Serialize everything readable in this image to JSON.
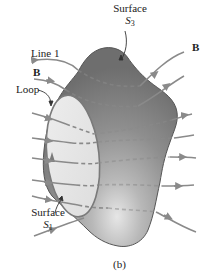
{
  "figure": {
    "caption": "(b)",
    "labels": {
      "surface_s3": {
        "line1": "Surface",
        "symbol": "S",
        "subscript": "3"
      },
      "surface_s1": {
        "line1": "Surface",
        "symbol": "S",
        "subscript": "1"
      },
      "line1": "Line 1",
      "b_left": "B",
      "b_right": "B",
      "loop": "Loop"
    },
    "colors": {
      "surface_dark": "#7a7a7a",
      "surface_mid": "#9a9a9a",
      "surface_light": "#d0d0d0",
      "loop_fill": "#e8e8e8",
      "field_line": "#8a8a8a",
      "outline": "#555555"
    }
  }
}
